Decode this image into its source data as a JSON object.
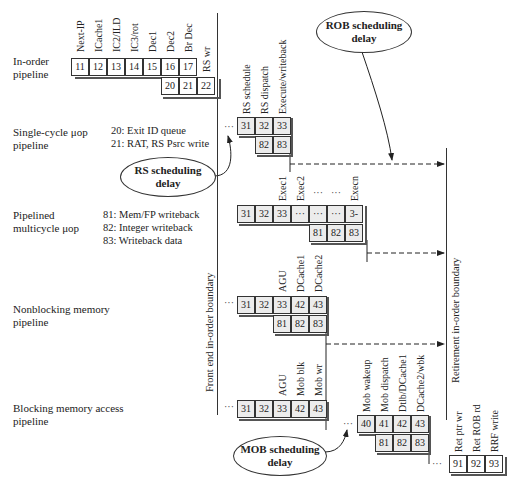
{
  "rows": {
    "inorder": {
      "label1": "In-order",
      "label2": "pipeline"
    },
    "singlecycle": {
      "label1": "Single-cycle μop",
      "label2": "pipeline",
      "notes": [
        "20: Exit ID queue",
        "21: RAT, RS Psrc write"
      ]
    },
    "pipelined": {
      "label1": "Pipelined",
      "label2": "multicycle μop",
      "notes": [
        "81: Mem/FP writeback",
        "82: Integer writeback",
        "83: Writeback data"
      ]
    },
    "nonblocking": {
      "label1": "Nonblocking memory",
      "label2": "pipeline"
    },
    "blocking": {
      "label1": "Blocking memory access",
      "label2": "pipeline"
    }
  },
  "inorder_stages": {
    "headers": [
      "Next-IP",
      "ICache1",
      "IC2/ILD",
      "IC3/rot",
      "Dec1",
      "Dec2",
      "Br Dec",
      "RS wr"
    ],
    "row1": [
      "11",
      "12",
      "13",
      "14",
      "15",
      "16",
      "17"
    ],
    "row2": [
      "20",
      "21",
      "22"
    ]
  },
  "single_stages": {
    "headers": [
      "RS schedule",
      "RS dispatch",
      "Execute/writeback"
    ],
    "row1": [
      "31",
      "32",
      "33"
    ],
    "row2": [
      "82",
      "83"
    ]
  },
  "multi_stages": {
    "headers": [
      "Exec1",
      "Exec2",
      "···",
      "···",
      "Execn"
    ],
    "row1": [
      "31",
      "32",
      "33",
      "···",
      "···",
      "···",
      "3-"
    ],
    "row2": [
      "81",
      "82",
      "83"
    ]
  },
  "nonblock_stages": {
    "headers": [
      "AGU",
      "DCache1",
      "DCache2"
    ],
    "row1": [
      "31",
      "32",
      "33",
      "42",
      "43"
    ],
    "row2": [
      "81",
      "82",
      "83"
    ]
  },
  "block_stages": {
    "headers": [
      "AGU",
      "Mob blk",
      "Mob wr"
    ],
    "row1": [
      "31",
      "32",
      "33",
      "42",
      "43"
    ]
  },
  "mob_stages": {
    "headers": [
      "Mob wakeup",
      "Mob dispatch",
      "Dtlb/DCache1",
      "DCache2/wbk"
    ],
    "row1": [
      "40",
      "41",
      "42",
      "43"
    ],
    "row2": [
      "81",
      "82",
      "83"
    ]
  },
  "retire_stages": {
    "headers": [
      "Ret ptr wr",
      "Ret ROB rd",
      "RRF write"
    ],
    "row1": [
      "91",
      "92",
      "93"
    ]
  },
  "boundaries": {
    "front": "Front end in-order boundary",
    "retire": "Retirement in-order boundary"
  },
  "bubbles": {
    "rob": {
      "line1": "ROB scheduling",
      "line2": "delay"
    },
    "rs": {
      "line1": "RS scheduling",
      "line2": "delay"
    },
    "mob": {
      "line1": "MOB scheduling",
      "line2": "delay"
    }
  },
  "ellipsis": "···"
}
